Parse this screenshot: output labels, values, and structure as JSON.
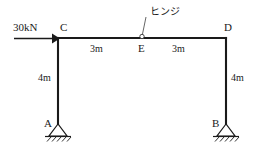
{
  "diagram": {
    "type": "structural-portal-frame",
    "load": {
      "label": "30kN",
      "direction": "horizontal-right",
      "applied_at": "C"
    },
    "annotation": {
      "label": "ヒンジ",
      "meaning": "hinge",
      "points_to": "E"
    },
    "nodes": [
      {
        "id": "A",
        "label": "A",
        "support": "pin"
      },
      {
        "id": "B",
        "label": "B",
        "support": "pin"
      },
      {
        "id": "C",
        "label": "C",
        "support": "none"
      },
      {
        "id": "D",
        "label": "D",
        "support": "none"
      },
      {
        "id": "E",
        "label": "E",
        "support": "hinge"
      }
    ],
    "dimensions": [
      {
        "id": "span-left",
        "label": "3m",
        "from": "C",
        "to": "E"
      },
      {
        "id": "span-right",
        "label": "3m",
        "from": "E",
        "to": "D"
      },
      {
        "id": "height-left",
        "label": "4m",
        "from": "A",
        "to": "C"
      },
      {
        "id": "height-right",
        "label": "4m",
        "from": "B",
        "to": "D"
      }
    ],
    "colors": {
      "member": "#1a1a1a",
      "background": "#ffffff",
      "leader": "#555555"
    }
  }
}
